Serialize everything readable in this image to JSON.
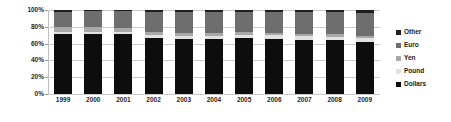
{
  "chart_data": {
    "type": "bar",
    "subtype": "stacked-100-percent",
    "title": "",
    "xlabel": "",
    "ylabel": "",
    "ylim": [
      0,
      100
    ],
    "yticks": [
      0,
      20,
      40,
      60,
      80,
      100
    ],
    "ytick_labels": [
      "0%",
      "20%",
      "40%",
      "60%",
      "80%",
      "100%"
    ],
    "grid": true,
    "legend_position": "right",
    "categories": [
      "1999",
      "2000",
      "2001",
      "2002",
      "2003",
      "2004",
      "2005",
      "2006",
      "2007",
      "2008",
      "2009"
    ],
    "series": [
      {
        "name": "Dollars",
        "color": "#0d0d0d",
        "values": [
          71.0,
          71.1,
          71.5,
          67.1,
          65.9,
          65.9,
          66.9,
          65.5,
          64.1,
          64.1,
          62.1
        ]
      },
      {
        "name": "Pound",
        "color": "#e2e2e2",
        "values": [
          2.9,
          2.8,
          2.7,
          2.9,
          2.8,
          3.4,
          3.6,
          4.4,
          4.7,
          4.0,
          4.3
        ]
      },
      {
        "name": "Yen",
        "color": "#a8a8a8",
        "values": [
          6.4,
          6.1,
          5.0,
          4.4,
          3.9,
          3.8,
          3.6,
          3.1,
          2.9,
          3.1,
          3.0
        ]
      },
      {
        "name": "Euro",
        "color": "#6e6e6e",
        "values": [
          17.9,
          18.3,
          19.2,
          23.8,
          25.2,
          24.8,
          23.9,
          25.1,
          26.3,
          26.4,
          27.4
        ]
      },
      {
        "name": "Other",
        "color": "#1f1f1f",
        "values": [
          1.8,
          1.7,
          1.6,
          1.8,
          2.2,
          2.1,
          2.0,
          1.9,
          2.0,
          2.4,
          3.2
        ]
      }
    ],
    "legend_entries": [
      {
        "label": "Other",
        "color": "#1f1f1f"
      },
      {
        "label": "Euro",
        "color": "#6e6e6e"
      },
      {
        "label": "Yen",
        "color": "#a8a8a8"
      },
      {
        "label": "Pound",
        "color": "#e2e2e2"
      },
      {
        "label": "Dollars",
        "color": "#0d0d0d"
      }
    ]
  },
  "axes": {
    "gridline_color": "#c9c9c9",
    "axis_color": "#bdbdbd"
  }
}
